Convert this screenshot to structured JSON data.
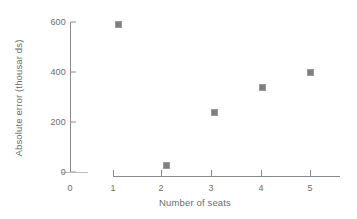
{
  "chart_data": {
    "type": "scatter",
    "title": "",
    "xlabel": "Number of seats",
    "ylabel": "Absolute error (thousar ds)",
    "x": [
      1,
      2,
      3,
      4,
      5
    ],
    "values": [
      590,
      28,
      237,
      338,
      400
    ],
    "series": [
      {
        "name": "Absolute error",
        "x": [
          1,
          2,
          3,
          4,
          5
        ],
        "values": [
          590,
          28,
          237,
          338,
          400
        ],
        "marker": "square",
        "color": "#808080"
      }
    ],
    "xlim": [
      0,
      5.6
    ],
    "ylim": [
      0,
      600
    ],
    "xticks": [
      0,
      1,
      2,
      3,
      4,
      5
    ],
    "yticks": [
      0,
      200,
      400,
      600
    ],
    "xtick_labels": [
      "0",
      "1",
      "2",
      "3",
      "4",
      "5"
    ],
    "ytick_labels": [
      "0",
      "200",
      "400",
      "600"
    ],
    "grid": false,
    "legend": null,
    "annotations": []
  },
  "axis": {
    "y_label": "Absolute error (thousar ds)",
    "x_label": "Number of seats",
    "y_ticks": [
      "600",
      "400",
      "200",
      "0"
    ],
    "x_ticks": [
      "0",
      "1",
      "2",
      "3",
      "4",
      "5"
    ]
  },
  "colors": {
    "marker": "#808080",
    "axis": "#8a8a8a",
    "text": "#6b6b6b",
    "background": "#ffffff"
  }
}
